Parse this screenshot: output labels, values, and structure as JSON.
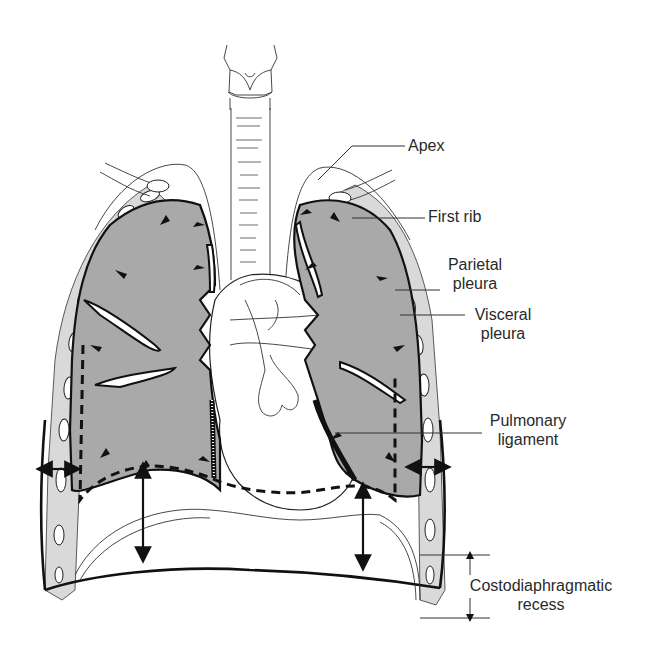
{
  "figure": {
    "labels": {
      "apex": "Apex",
      "first_rib": "First rib",
      "parietal_pleura_line1": "Parietal",
      "parietal_pleura_line2": "pleura",
      "visceral_pleura_line1": "Visceral",
      "visceral_pleura_line2": "pleura",
      "pulmonary_ligament_line1": "Pulmonary",
      "pulmonary_ligament_line2": "ligament",
      "costodiaphragmatic_recess_line1": "Costodiaphragmatic",
      "costodiaphragmatic_recess_line2": "recess"
    },
    "colors": {
      "lung_fill": "#a9a9a9",
      "line": "#111111",
      "background": "#ffffff",
      "label_text": "#2a2a2a"
    }
  }
}
